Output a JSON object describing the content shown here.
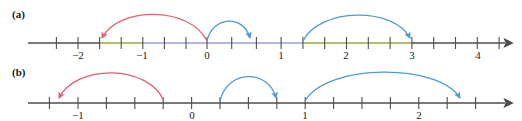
{
  "figure": {
    "width": 522,
    "height": 121,
    "background": "#ffffff",
    "colors": {
      "axis": "#4d4d4d",
      "axis_olive": "#9aa63c",
      "axis_violet": "#9a9ade",
      "arc_red": "#e0606e",
      "arc_blue": "#4f9ad7",
      "text": "#1a1a1a"
    }
  },
  "panels": [
    {
      "id": "a",
      "label": "(a)",
      "axis": {
        "y": 43,
        "x_start": 28,
        "x_end": 505,
        "origin_x": 207,
        "unit_px": 64.7,
        "tick_step_units": 0.3333,
        "arrow": "right"
      },
      "tick_labels": [
        {
          "text": "−2",
          "value": -2,
          "x": 78,
          "y": 57
        },
        {
          "text": "−1",
          "value": -1,
          "x": 142,
          "y": 57
        },
        {
          "text": "0",
          "value": 0,
          "x": 207,
          "y": 57
        },
        {
          "text": "1",
          "value": 1,
          "x": 281,
          "y": 57
        },
        {
          "text": "2",
          "value": 2,
          "x": 346,
          "y": 57
        },
        {
          "text": "3",
          "value": 3,
          "x": 412,
          "y": 57
        },
        {
          "text": "4",
          "value": 4,
          "x": 478,
          "y": 57
        }
      ],
      "segments": [
        {
          "from_x": 28,
          "to_x": 100,
          "color": "#4d4d4d"
        },
        {
          "from_x": 100,
          "to_x": 143,
          "color": "#9aa63c"
        },
        {
          "from_x": 143,
          "to_x": 303,
          "color": "#9a9ade"
        },
        {
          "from_x": 303,
          "to_x": 412,
          "color": "#9aa63c"
        },
        {
          "from_x": 412,
          "to_x": 505,
          "color": "#4d4d4d"
        }
      ],
      "arcs": [
        {
          "name": "red-arc-left",
          "color": "#e0606e",
          "from_x": 207,
          "to_x": 100,
          "from_value": 0,
          "to_value": -1.667,
          "peak_y": 10,
          "direction": "leftward"
        },
        {
          "name": "blue-arc-small",
          "color": "#4f9ad7",
          "from_x": 207,
          "to_x": 251,
          "from_value": 0,
          "to_value": 0.667,
          "peak_y": 19,
          "direction": "rightward"
        },
        {
          "name": "blue-arc-large",
          "color": "#4f9ad7",
          "from_x": 303,
          "to_x": 412,
          "from_value": 1.5,
          "to_value": 3,
          "peak_y": 10,
          "direction": "rightward"
        }
      ]
    },
    {
      "id": "b",
      "label": "(b)",
      "axis": {
        "y": 43,
        "x_start": 28,
        "x_end": 505,
        "origin_x": 192,
        "unit_px": 113.5,
        "tick_step_units": 0.25,
        "arrow": "right"
      },
      "tick_labels": [
        {
          "text": "−1",
          "value": -1,
          "x": 78,
          "y": 57
        },
        {
          "text": "0",
          "value": 0,
          "x": 192,
          "y": 57
        },
        {
          "text": "1",
          "value": 1,
          "x": 305,
          "y": 57
        },
        {
          "text": "2",
          "value": 2,
          "x": 419,
          "y": 57
        }
      ],
      "segments": [
        {
          "from_x": 28,
          "to_x": 505,
          "color": "#4d4d4d"
        }
      ],
      "arcs": [
        {
          "name": "red-arc-left",
          "color": "#e0606e",
          "from_x": 164,
          "to_x": 57,
          "from_value": -0.25,
          "to_value": -1.2,
          "peak_y": 10,
          "direction": "leftward"
        },
        {
          "name": "blue-arc-first",
          "color": "#4f9ad7",
          "from_x": 220,
          "to_x": 277,
          "from_value": 0.25,
          "to_value": 0.75,
          "peak_y": 14,
          "direction": "rightward"
        },
        {
          "name": "blue-arc-second",
          "color": "#4f9ad7",
          "from_x": 305,
          "to_x": 462,
          "from_value": 1,
          "to_value": 2.38,
          "peak_y": 9,
          "direction": "rightward"
        }
      ]
    }
  ]
}
